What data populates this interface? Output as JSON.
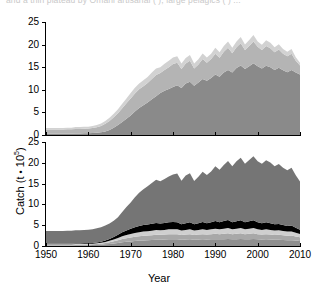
{
  "caption": {
    "text": "and a thin plateau by Omani artisanal ( ), large pelagics ( ) ..."
  },
  "axes": {
    "ylabel_main": "Catch",
    "ylabel_units_pre": "(t ",
    "ylabel_units_dot": "•",
    "ylabel_units_base": " 10",
    "ylabel_units_exp": "5",
    "ylabel_units_post": ")",
    "xlabel": "Year",
    "yticks": [
      0,
      5,
      10,
      15,
      20,
      25
    ],
    "xticks": [
      1950,
      1960,
      1970,
      1980,
      1990,
      2000,
      2010
    ],
    "ylim": [
      0,
      25
    ],
    "xlim": [
      1950,
      2010
    ],
    "grid": false
  },
  "panels": [
    {
      "letter": "A)",
      "legend_position": "top-left-inside",
      "legend_rows": [
        [
          "Industrial",
          "Artisanal",
          "Subsistence"
        ]
      ]
    },
    {
      "letter": "B)",
      "legend_position": "top-left-inside",
      "legend_rows": [
        [
          "Threadfin/whiptail breams",
          "Indian mackerel"
        ],
        [
          "Lizardfishes",
          "Ponyfishes"
        ],
        [
          "Others"
        ]
      ]
    }
  ],
  "colors": {
    "industrial": "#8a8a8a",
    "artisanal": "#b4b4b4",
    "subsistence": "#d2d2d2",
    "breams": "#8f8f8f",
    "indian_mackerel": "#a8a8a8",
    "lizardfishes": "#cfcfcf",
    "ponyfishes": "#000000",
    "others": "#757575",
    "axis": "#000000",
    "background": "#ffffff"
  },
  "chart_data": [
    {
      "type": "area",
      "panel": "A",
      "title": "",
      "xlabel": "Year",
      "ylabel": "Catch (t • 10^5)",
      "stacked": true,
      "xlim": [
        1950,
        2010
      ],
      "ylim": [
        0,
        25
      ],
      "x": [
        1950,
        1951,
        1952,
        1953,
        1954,
        1955,
        1956,
        1957,
        1958,
        1959,
        1960,
        1961,
        1962,
        1963,
        1964,
        1965,
        1966,
        1967,
        1968,
        1969,
        1970,
        1971,
        1972,
        1973,
        1974,
        1975,
        1976,
        1977,
        1978,
        1979,
        1980,
        1981,
        1982,
        1983,
        1984,
        1985,
        1986,
        1987,
        1988,
        1989,
        1990,
        1991,
        1992,
        1993,
        1994,
        1995,
        1996,
        1997,
        1998,
        1999,
        2000,
        2001,
        2002,
        2003,
        2004,
        2005,
        2006,
        2007,
        2008,
        2009,
        2010
      ],
      "series": [
        {
          "name": "Industrial",
          "color": "#8a8a8a",
          "values": [
            0.3,
            0.3,
            0.3,
            0.3,
            0.3,
            0.3,
            0.3,
            0.35,
            0.35,
            0.4,
            0.4,
            0.45,
            0.5,
            0.6,
            0.8,
            1.1,
            1.6,
            2.2,
            2.9,
            3.6,
            4.3,
            5.2,
            6.0,
            6.6,
            7.2,
            7.9,
            8.6,
            9.3,
            9.8,
            10.2,
            10.6,
            11.0,
            10.4,
            11.4,
            11.8,
            10.9,
            11.6,
            12.4,
            12.0,
            12.6,
            13.4,
            12.9,
            13.8,
            14.4,
            13.8,
            14.8,
            15.4,
            14.6,
            15.2,
            15.9,
            15.2,
            14.7,
            15.3,
            15.0,
            14.4,
            14.9,
            14.3,
            13.9,
            14.4,
            13.8,
            13.4
          ]
        },
        {
          "name": "Artisanal",
          "color": "#b4b4b4",
          "values": [
            0.9,
            0.9,
            0.9,
            0.9,
            0.9,
            0.95,
            0.95,
            1.0,
            1.0,
            1.0,
            1.05,
            1.1,
            1.2,
            1.4,
            1.7,
            2.0,
            2.3,
            2.6,
            3.0,
            3.4,
            3.8,
            4.0,
            4.1,
            4.2,
            4.3,
            4.5,
            4.7,
            4.4,
            4.6,
            4.8,
            5.1,
            5.0,
            4.2,
            4.4,
            4.6,
            3.8,
            4.0,
            4.4,
            4.0,
            4.2,
            4.6,
            4.2,
            4.6,
            4.9,
            4.3,
            4.6,
            4.9,
            4.2,
            4.5,
            4.8,
            4.3,
            4.1,
            4.4,
            4.2,
            3.9,
            4.0,
            3.7,
            3.5,
            3.6,
            2.6,
            2.0
          ]
        },
        {
          "name": "Subsistence",
          "color": "#d2d2d2",
          "values": [
            0.35,
            0.35,
            0.35,
            0.35,
            0.35,
            0.35,
            0.35,
            0.4,
            0.4,
            0.4,
            0.4,
            0.45,
            0.5,
            0.55,
            0.6,
            0.7,
            0.8,
            0.9,
            1.0,
            1.1,
            1.2,
            1.25,
            1.3,
            1.3,
            1.35,
            1.4,
            1.4,
            1.3,
            1.35,
            1.4,
            1.45,
            1.4,
            1.2,
            1.25,
            1.3,
            1.1,
            1.15,
            1.25,
            1.15,
            1.2,
            1.3,
            1.2,
            1.3,
            1.4,
            1.2,
            1.3,
            1.4,
            1.2,
            1.3,
            1.4,
            1.2,
            1.15,
            1.25,
            1.2,
            1.1,
            1.15,
            1.05,
            1.0,
            1.05,
            0.8,
            0.6
          ]
        }
      ]
    },
    {
      "type": "area",
      "panel": "B",
      "title": "",
      "xlabel": "Year",
      "ylabel": "Catch (t • 10^5)",
      "stacked": true,
      "xlim": [
        1950,
        2010
      ],
      "ylim": [
        0,
        25
      ],
      "x": [
        1950,
        1951,
        1952,
        1953,
        1954,
        1955,
        1956,
        1957,
        1958,
        1959,
        1960,
        1961,
        1962,
        1963,
        1964,
        1965,
        1966,
        1967,
        1968,
        1969,
        1970,
        1971,
        1972,
        1973,
        1974,
        1975,
        1976,
        1977,
        1978,
        1979,
        1980,
        1981,
        1982,
        1983,
        1984,
        1985,
        1986,
        1987,
        1988,
        1989,
        1990,
        1991,
        1992,
        1993,
        1994,
        1995,
        1996,
        1997,
        1998,
        1999,
        2000,
        2001,
        2002,
        2003,
        2004,
        2005,
        2006,
        2007,
        2008,
        2009,
        2010
      ],
      "series": [
        {
          "name": "Threadfin/whiptail breams",
          "color": "#8f8f8f",
          "values": [
            0.15,
            0.15,
            0.15,
            0.15,
            0.15,
            0.15,
            0.15,
            0.18,
            0.18,
            0.2,
            0.2,
            0.22,
            0.25,
            0.3,
            0.4,
            0.5,
            0.6,
            0.75,
            0.9,
            1.0,
            1.1,
            1.2,
            1.3,
            1.35,
            1.4,
            1.45,
            1.5,
            1.5,
            1.55,
            1.6,
            1.6,
            1.6,
            1.5,
            1.55,
            1.6,
            1.5,
            1.55,
            1.6,
            1.55,
            1.6,
            1.65,
            1.6,
            1.65,
            1.7,
            1.6,
            1.65,
            1.7,
            1.6,
            1.65,
            1.7,
            1.6,
            1.55,
            1.6,
            1.55,
            1.5,
            1.5,
            1.45,
            1.4,
            1.4,
            1.3,
            1.2
          ]
        },
        {
          "name": "Indian mackerel",
          "color": "#a8a8a8",
          "values": [
            0.15,
            0.15,
            0.15,
            0.15,
            0.15,
            0.15,
            0.15,
            0.17,
            0.17,
            0.18,
            0.18,
            0.2,
            0.22,
            0.26,
            0.33,
            0.42,
            0.52,
            0.65,
            0.78,
            0.88,
            0.95,
            1.0,
            1.05,
            1.1,
            1.12,
            1.15,
            1.2,
            1.18,
            1.2,
            1.25,
            1.25,
            1.25,
            1.15,
            1.2,
            1.25,
            1.15,
            1.2,
            1.25,
            1.2,
            1.25,
            1.3,
            1.25,
            1.3,
            1.35,
            1.25,
            1.3,
            1.35,
            1.25,
            1.3,
            1.35,
            1.25,
            1.2,
            1.25,
            1.2,
            1.15,
            1.18,
            1.12,
            1.08,
            1.1,
            1.0,
            0.9
          ]
        },
        {
          "name": "Lizardfishes",
          "color": "#cfcfcf",
          "values": [
            0.1,
            0.1,
            0.1,
            0.1,
            0.1,
            0.1,
            0.1,
            0.12,
            0.12,
            0.13,
            0.13,
            0.15,
            0.17,
            0.2,
            0.26,
            0.34,
            0.44,
            0.55,
            0.67,
            0.77,
            0.85,
            0.92,
            0.98,
            1.02,
            1.05,
            1.08,
            1.12,
            1.1,
            1.12,
            1.15,
            1.18,
            1.15,
            1.05,
            1.1,
            1.15,
            1.05,
            1.1,
            1.15,
            1.1,
            1.15,
            1.2,
            1.15,
            1.2,
            1.25,
            1.15,
            1.2,
            1.25,
            1.15,
            1.2,
            1.25,
            1.15,
            1.12,
            1.15,
            1.1,
            1.05,
            1.08,
            1.02,
            0.98,
            1.0,
            0.9,
            0.8
          ]
        },
        {
          "name": "Ponyfishes",
          "color": "#000000",
          "values": [
            0.12,
            0.12,
            0.12,
            0.12,
            0.12,
            0.12,
            0.12,
            0.14,
            0.14,
            0.15,
            0.15,
            0.17,
            0.2,
            0.25,
            0.33,
            0.45,
            0.6,
            0.78,
            0.95,
            1.1,
            1.25,
            1.4,
            1.5,
            1.55,
            1.6,
            1.65,
            1.7,
            1.6,
            1.65,
            1.7,
            1.75,
            1.7,
            1.5,
            1.6,
            1.7,
            1.5,
            1.6,
            1.75,
            1.6,
            1.7,
            1.85,
            1.7,
            1.85,
            1.95,
            1.7,
            1.8,
            1.9,
            1.7,
            1.8,
            1.9,
            1.7,
            1.6,
            1.7,
            1.6,
            1.5,
            1.55,
            1.45,
            1.35,
            1.4,
            1.2,
            1.0
          ]
        },
        {
          "name": "Others",
          "color": "#757575",
          "values": [
            3.1,
            3.1,
            3.1,
            3.1,
            3.1,
            3.15,
            3.15,
            3.2,
            3.2,
            3.2,
            3.25,
            3.3,
            3.4,
            3.5,
            3.6,
            3.7,
            3.9,
            4.2,
            4.9,
            5.6,
            6.3,
            7.2,
            8.0,
            8.6,
            9.2,
            9.8,
            10.4,
            10.2,
            10.6,
            11.0,
            11.4,
            11.7,
            10.5,
            11.5,
            11.8,
            10.4,
            11.2,
            12.1,
            11.6,
            12.2,
            13.2,
            12.6,
            13.5,
            14.2,
            13.5,
            14.4,
            15.0,
            14.1,
            14.7,
            15.4,
            14.7,
            14.3,
            14.9,
            14.6,
            14.0,
            14.4,
            13.8,
            13.4,
            13.9,
            12.6,
            11.6
          ]
        }
      ]
    }
  ]
}
